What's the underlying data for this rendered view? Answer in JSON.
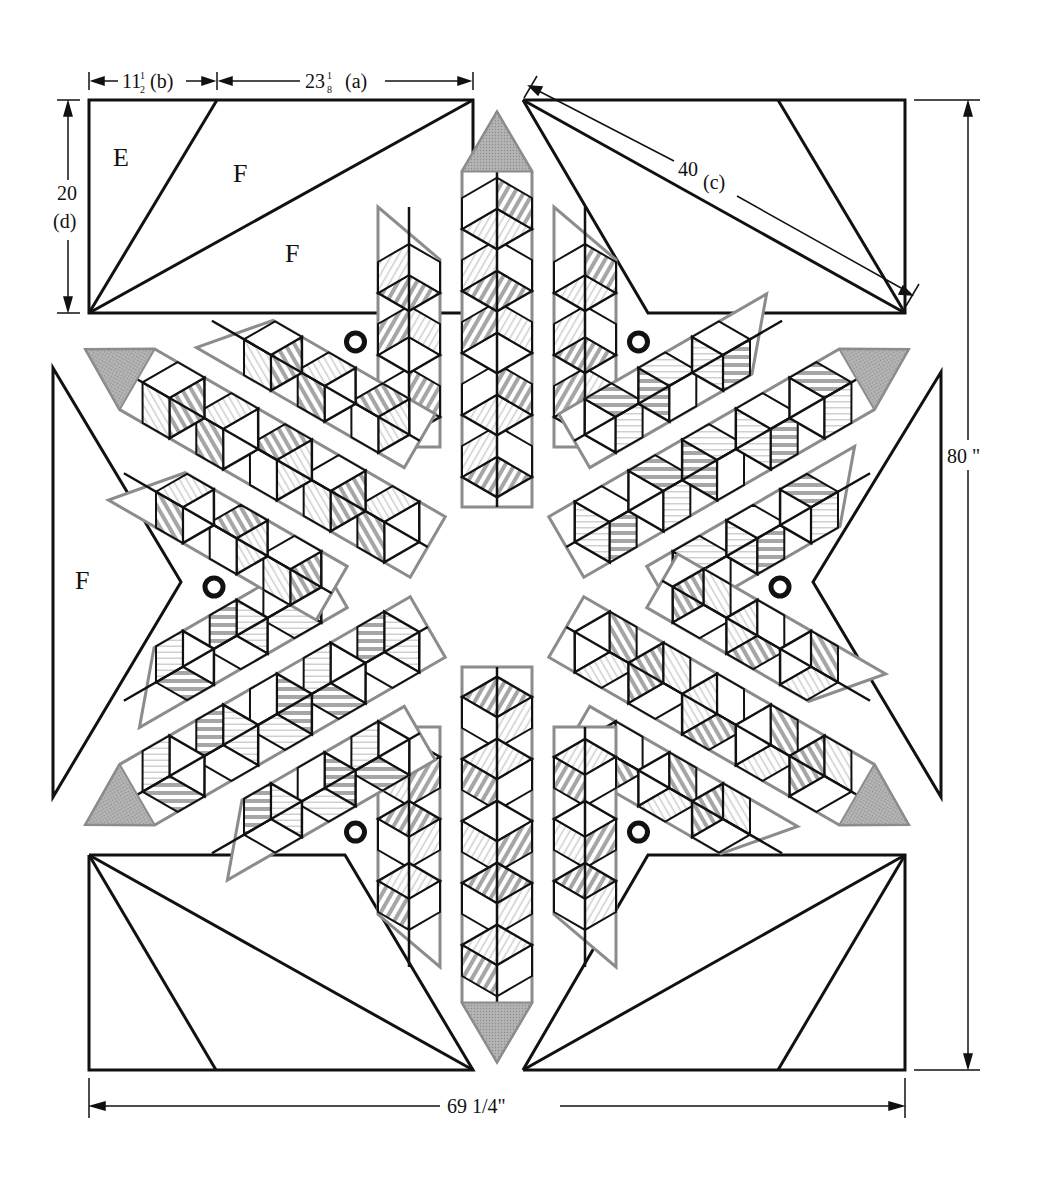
{
  "colors": {
    "line": "#111111",
    "grey_fill": "#a8a8a8",
    "stripe": "#9a9a9a",
    "light_stripe": "#cfcfcf",
    "outline_grey": "#8c8c8c",
    "background": "#ffffff"
  },
  "dimensions": {
    "top_b": {
      "whole": "11",
      "num": "1",
      "den": "2",
      "tag": "(b)"
    },
    "top_a": {
      "whole": "23",
      "num": "1",
      "den": "8",
      "tag": "(a)"
    },
    "diag_c": {
      "value": "40",
      "tag": "(c)"
    },
    "left_d": {
      "value": "20",
      "tag": "(d)"
    },
    "right_total": "80 \"",
    "bottom_total": "69 1/4\""
  },
  "piece_labels": {
    "e": "E",
    "f_top_upper": "F",
    "f_top_lower": "F",
    "f_left": "F"
  },
  "star": {
    "center": [
      497,
      587
    ],
    "points": 6,
    "tip_distance": 475,
    "point_angles_deg": [
      -90,
      -30,
      30,
      90,
      150,
      210
    ],
    "connector_rings": 6
  }
}
